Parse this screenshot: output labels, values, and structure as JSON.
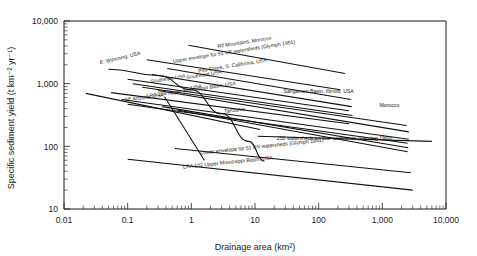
{
  "chart_data": {
    "type": "line",
    "title": "",
    "xlabel": "Drainage area (km²)",
    "ylabel": "Specific sediment yield (t km⁻² yr⁻¹)",
    "xscale": "log",
    "yscale": "log",
    "xlim": [
      0.01,
      10000
    ],
    "ylim": [
      10,
      10000
    ],
    "grid": false,
    "legend": "inline-labels",
    "xticklabels": [
      "0.01",
      "0.1",
      "1",
      "10",
      "100",
      "1,000",
      "10,000"
    ],
    "xtickvalues": [
      0.01,
      0.1,
      1,
      10,
      100,
      1000,
      10000
    ],
    "yticklabels": [
      "10,000",
      "1,000",
      "100",
      "10"
    ],
    "ytickvalues": [
      10000,
      1000,
      100,
      10
    ],
    "series": [
      {
        "name": "E. Wyoming, USA",
        "label": "E. Wyoming, USA",
        "shape": "curve",
        "label_x": 0.037,
        "label_y": 2050,
        "label_rotation": -13,
        "points": [
          [
            0.05,
            1700
          ],
          [
            0.3,
            1350
          ],
          [
            1.0,
            800
          ],
          [
            3.0,
            330
          ],
          [
            8.0,
            120
          ],
          [
            14.0,
            58
          ]
        ]
      },
      {
        "name": "SE Arizona, USA",
        "label": "SE Arizona, USA",
        "shape": "line",
        "label_x": 0.09,
        "label_y": 520,
        "label_rotation": -7,
        "points": [
          [
            0.022,
            700
          ],
          [
            12.0,
            185
          ]
        ]
      },
      {
        "name": "Rif Mountains, Morocco",
        "label": "Rif Mountains, Morocco",
        "shape": "line",
        "label_x": 2.6,
        "label_y": 3700,
        "label_rotation": -9,
        "points": [
          [
            0.9,
            4100
          ],
          [
            260.0,
            1450
          ]
        ]
      },
      {
        "name": "Upper envelope for 51 US watersheds (Glymph 1951)",
        "label": "Upper envelope for 51 US watersheds (Glymph 1951)",
        "shape": "line",
        "label_x": 0.52,
        "label_y": 2150,
        "label_rotation": -9,
        "points": [
          [
            0.2,
            2400
          ],
          [
            220.0,
            800
          ]
        ]
      },
      {
        "name": "Piru Creek, S. California, USA",
        "label": "Piru Creek, S. California, USA",
        "shape": "line",
        "label_x": 1.3,
        "label_y": 1500,
        "label_rotation": -9,
        "points": [
          [
            0.42,
            1750
          ],
          [
            320.0,
            560
          ]
        ]
      },
      {
        "name": "Southeast USA (upper)",
        "label": "Southeast USA",
        "shape": "line",
        "label_x": 0.85,
        "label_y": 1180,
        "label_rotation": -9,
        "points": [
          [
            0.24,
            1400
          ],
          [
            330.0,
            430
          ]
        ]
      },
      {
        "name": "Southeast USA (middle)",
        "label": "Southeast USA",
        "shape": "line",
        "label_x": 0.23,
        "label_y": 1020,
        "label_rotation": -9,
        "points": [
          [
            0.1,
            1180
          ],
          [
            300.0,
            370
          ]
        ]
      },
      {
        "name": "Southeast USA (lower)",
        "label": "USA",
        "shape": "line",
        "label_x": 1.0,
        "label_y": 810,
        "label_rotation": -9,
        "points": [
          [
            0.12,
            1000
          ],
          [
            340.0,
            310
          ]
        ]
      },
      {
        "name": "LRA 108 Upper Mississippi Basin, USA",
        "label": "LRA 108 Upper Mississippi Basin, USA",
        "shape": "line",
        "label_x": 0.2,
        "label_y": 600,
        "label_rotation": -8,
        "points": [
          [
            0.055,
            720
          ],
          [
            300.0,
            230
          ]
        ]
      },
      {
        "name": "Sangamon Basin, Illinois, USA",
        "label": "Sangamon Basin, Illinois, USA",
        "shape": "line",
        "label_x": 28.0,
        "label_y": 700,
        "label_rotation": 0,
        "points": [
          [
            0.17,
            880
          ],
          [
            2400.0,
            215
          ]
        ]
      },
      {
        "name": "Morocco",
        "label": "Morocco",
        "shape": "line",
        "label_x": 900.0,
        "label_y": 430,
        "label_rotation": 0,
        "points": [
          [
            0.3,
            780
          ],
          [
            2600.0,
            170
          ]
        ]
      },
      {
        "name": "Tanzania",
        "label": "Tanzania",
        "shape": "line",
        "label_x": 3.3,
        "label_y": 340,
        "label_rotation": -7,
        "points": [
          [
            0.08,
            560
          ],
          [
            2600.0,
            130
          ]
        ]
      },
      {
        "name": "unlabelled band a",
        "label": "",
        "shape": "line",
        "points": [
          [
            0.1,
            470
          ],
          [
            2500.0,
            112
          ]
        ]
      },
      {
        "name": "unlabelled band b",
        "label": "",
        "shape": "line",
        "points": [
          [
            0.35,
            430
          ],
          [
            2550.0,
            95
          ]
        ]
      },
      {
        "name": "unlabelled band c",
        "label": "",
        "shape": "line",
        "points": [
          [
            0.6,
            380
          ],
          [
            2500.0,
            82
          ]
        ]
      },
      {
        "name": "250 watersheds on four continents (Fleming 1969)",
        "label": "250 watersheds on four continents (Fleming 1969)",
        "shape": "line",
        "label_x": 22.0,
        "label_y": 125,
        "label_rotation": 0,
        "points": [
          [
            11.0,
            145
          ],
          [
            6000.0,
            120
          ]
        ]
      },
      {
        "name": "Lower envelope for 51 US watersheds (Glymph 1951)",
        "label": "Lower envelope for 51 US watersheds (Glymph 1951)",
        "shape": "line",
        "label_x": 1.4,
        "label_y": 74,
        "label_rotation": -6,
        "points": [
          [
            0.55,
            92
          ],
          [
            2800.0,
            38
          ]
        ]
      },
      {
        "name": "LRA 102 Upper Mississippi Basin, USA",
        "label": "LRA 102 Upper Mississippi Basin, USA",
        "shape": "line",
        "label_x": 0.75,
        "label_y": 44,
        "label_rotation": -6,
        "points": [
          [
            0.1,
            62
          ],
          [
            3000.0,
            20
          ]
        ]
      },
      {
        "name": "steep descending line",
        "label": "",
        "shape": "line",
        "points": [
          [
            0.38,
            620
          ],
          [
            1.6,
            60
          ]
        ]
      }
    ]
  }
}
